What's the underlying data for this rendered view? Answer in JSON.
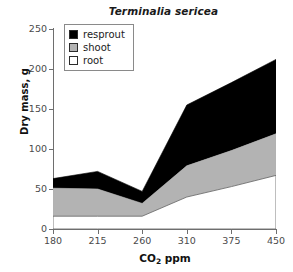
{
  "chart_data": {
    "type": "area",
    "title": "Terminalia sericea",
    "xlabel": "CO2 ppm",
    "xlabel_base": "CO",
    "xlabel_sub": "2",
    "xlabel_rest": " ppm",
    "ylabel": "Dry mass, g",
    "categories": [
      "180",
      "215",
      "260",
      "310",
      "375",
      "450"
    ],
    "x": [
      180,
      215,
      260,
      310,
      375,
      450
    ],
    "stacked": true,
    "grid": false,
    "legend_position": "top-left",
    "ylim": [
      0,
      250
    ],
    "yticks": [
      0,
      50,
      100,
      150,
      200,
      250
    ],
    "ytick_labels": [
      "0",
      "50",
      "100",
      "150",
      "200",
      "250"
    ],
    "xtick_labels": [
      "180",
      "215",
      "260",
      "310",
      "375",
      "450"
    ],
    "series": [
      {
        "name": "root",
        "color": "#ffffff",
        "values": [
          16,
          16,
          16,
          40,
          53,
          67
        ],
        "cumulative": [
          16,
          16,
          16,
          40,
          53,
          67
        ]
      },
      {
        "name": "shoot",
        "color": "#b3b3b3",
        "values": [
          35,
          34,
          16,
          39,
          45,
          52
        ],
        "cumulative": [
          51,
          50,
          32,
          79,
          98,
          119
        ]
      },
      {
        "name": "resprout",
        "color": "#000000",
        "values": [
          12,
          22,
          15,
          76,
          85,
          93
        ],
        "cumulative": [
          63,
          72,
          47,
          155,
          183,
          212
        ]
      }
    ]
  },
  "legend": {
    "items": [
      {
        "label": "resprout",
        "color": "#000000"
      },
      {
        "label": "shoot",
        "color": "#b3b3b3"
      },
      {
        "label": "root",
        "color": "#ffffff"
      }
    ]
  },
  "colors": {
    "axis": "#6e6e6e",
    "tick_text": "#4a4a4a",
    "title_text": "#1a1a1a",
    "outline": "#6e6e6e"
  }
}
